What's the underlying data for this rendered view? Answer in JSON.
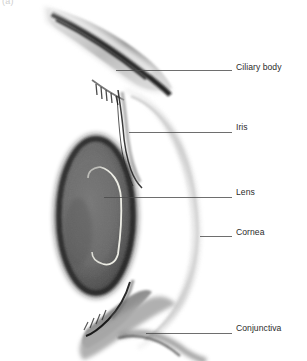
{
  "figure": {
    "panel_letter": "(a)",
    "background_color": "#ffffff",
    "width": 307,
    "height": 361
  },
  "callouts": [
    {
      "id": "ciliary-body",
      "label": "Ciliary body",
      "label_x": 236,
      "label_y": 62,
      "leader": {
        "x1": 116,
        "y1": 70,
        "x2": 232,
        "y2": 70
      },
      "target_structure": "ciliary body band at upper sclera"
    },
    {
      "id": "iris",
      "label": "Iris",
      "label_x": 236,
      "label_y": 122,
      "leader": {
        "x1": 129,
        "y1": 132,
        "x2": 232,
        "y2": 132
      },
      "target_structure": "thin iris strand anterior to lens"
    },
    {
      "id": "lens",
      "label": "Lens",
      "label_x": 236,
      "label_y": 187,
      "leader": {
        "x1": 104,
        "y1": 197,
        "x2": 232,
        "y2": 197
      },
      "target_structure": "dark elliptical lens body"
    },
    {
      "id": "cornea",
      "label": "Cornea",
      "label_x": 236,
      "label_y": 227,
      "leader": {
        "x1": 200,
        "y1": 236,
        "x2": 232,
        "y2": 236
      },
      "target_structure": "pale curved corneal band"
    },
    {
      "id": "conjunctiva",
      "label": "Conjunctiva",
      "label_x": 236,
      "label_y": 323,
      "leader": {
        "x1": 146,
        "y1": 333,
        "x2": 232,
        "y2": 333
      },
      "target_structure": "conjunctival fold at lower limbus"
    }
  ],
  "structures": {
    "lens": {
      "name": "Lens",
      "fill_color": "#6e6e6e",
      "rim_color": "#2a2a2a",
      "center_x": 96,
      "center_y": 216,
      "radius_x": 39,
      "radius_y": 79
    },
    "lens_capsule_outline": {
      "name": "Lens capsule highlight",
      "stroke_color": "#f2f2ea"
    },
    "cornea": {
      "name": "Cornea",
      "fill_color": "#d4d4d4",
      "description": "pale crescent bulging anteriorly to the right"
    },
    "sclera_superior": {
      "name": "Superior sclera / ciliary band",
      "fill_color": "#bdbdbd",
      "stripe_color": "#1b1b1b"
    },
    "sclera_inferior": {
      "name": "Inferior sclera / conjunctival fold",
      "fill_color": "#9e9e9e",
      "stripe_color": "#262626"
    },
    "iris": {
      "name": "Iris",
      "stroke_color": "#3a3a3a"
    }
  },
  "style": {
    "leader_line_color": "#4a4a4a",
    "leader_line_width": 0.8,
    "label_text_color": "#2b2b2b",
    "panel_letter_color": "#cfcfcf"
  }
}
